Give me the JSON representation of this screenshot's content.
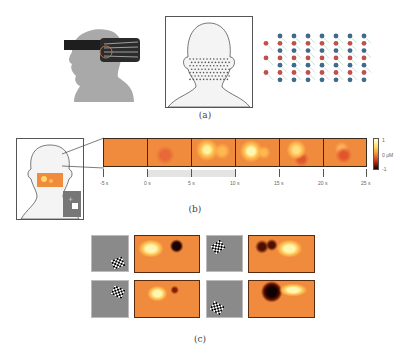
{
  "figure": {
    "panel_a": {
      "label": "(a)",
      "items": [
        "head-with-optode-cap-photo",
        "head-back-view-optode-grid",
        "source-detector-array-diagram"
      ],
      "array_colors": {
        "source": "#c0504d",
        "detector": "#3f6a8a",
        "channel": "#9fd3b0"
      }
    },
    "panel_b": {
      "label": "(b)",
      "time_ticks": [
        "-5 s",
        "0 s",
        "5 s",
        "10 s",
        "15 s",
        "20 s",
        "25 s"
      ],
      "frame_count": 6,
      "stimulus_interval": "0 s – 10 s",
      "colorbar": {
        "top": "1",
        "middle": "0 μM",
        "bottom": "-1"
      }
    },
    "panel_c": {
      "label": "(c)",
      "stimulus_positions": [
        "lower-right",
        "upper-left",
        "upper-right",
        "lower-left"
      ]
    }
  }
}
